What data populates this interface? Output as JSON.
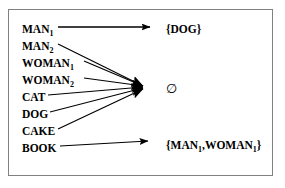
{
  "diagram": {
    "type": "mapping-diagram",
    "title": "",
    "border_color": "#808080",
    "background_color": "#ffffff",
    "line_color": "#000000",
    "sources": [
      {
        "id": "man1",
        "base": "MAN",
        "sub": "1",
        "x": 22,
        "y": 30
      },
      {
        "id": "man2",
        "base": "MAN",
        "sub": "2",
        "x": 22,
        "y": 47
      },
      {
        "id": "woman1",
        "base": "WOMAN",
        "sub": "1",
        "x": 22,
        "y": 64
      },
      {
        "id": "woman2",
        "base": "WOMAN",
        "sub": "2",
        "x": 22,
        "y": 81
      },
      {
        "id": "cat",
        "base": "CAT",
        "sub": "",
        "x": 22,
        "y": 98
      },
      {
        "id": "dog",
        "base": "DOG",
        "sub": "",
        "x": 22,
        "y": 115
      },
      {
        "id": "cake",
        "base": "CAKE",
        "sub": "",
        "x": 22,
        "y": 132
      },
      {
        "id": "book",
        "base": "BOOK",
        "sub": "",
        "x": 22,
        "y": 149
      }
    ],
    "targets": [
      {
        "id": "set-dog",
        "text": "{DOG}",
        "x": 166,
        "y": 30,
        "kind": "text"
      },
      {
        "id": "empty-set",
        "text": "∅",
        "x": 166,
        "y": 89,
        "kind": "symbol"
      },
      {
        "id": "set-man-woman",
        "parts": [
          "{MAN",
          "1",
          ",WOMAN",
          "1",
          "}"
        ],
        "x": 166,
        "y": 146,
        "kind": "text-sub"
      }
    ],
    "arrows": [
      {
        "from": "man1",
        "to": "set-dog",
        "x1": 58,
        "y1": 27,
        "x2": 155,
        "y2": 27
      },
      {
        "from": "man2",
        "to": "empty-set",
        "x1": 58,
        "y1": 44,
        "x2": 148,
        "y2": 86
      },
      {
        "from": "woman1",
        "to": "empty-set",
        "x1": 84,
        "y1": 61,
        "x2": 148,
        "y2": 86
      },
      {
        "from": "woman2",
        "to": "empty-set",
        "x1": 84,
        "y1": 78,
        "x2": 148,
        "y2": 86
      },
      {
        "from": "cat",
        "to": "empty-set",
        "x1": 48,
        "y1": 95,
        "x2": 148,
        "y2": 86
      },
      {
        "from": "dog",
        "to": "empty-set",
        "x1": 50,
        "y1": 112,
        "x2": 148,
        "y2": 86
      },
      {
        "from": "cake",
        "to": "empty-set",
        "x1": 58,
        "y1": 129,
        "x2": 148,
        "y2": 86
      },
      {
        "from": "book",
        "to": "set-man-woman",
        "x1": 60,
        "y1": 146,
        "x2": 153,
        "y2": 142
      }
    ]
  }
}
